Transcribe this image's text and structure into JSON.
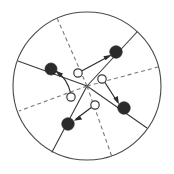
{
  "figure": {
    "title": "",
    "type": "radial-node-diagram",
    "canvas": {
      "width": 174,
      "height": 174,
      "background": "#ffffff"
    },
    "colors": {
      "outline": "#4a4a4a",
      "solid_spoke": "#3a3a3a",
      "dashed_spoke": "#7a7a7a",
      "filled_node": "#2b2b2b",
      "open_node_fill": "#ffffff",
      "open_node_stroke": "#3a3a3a",
      "arrow": "#2b2b2b"
    },
    "boundary": {
      "name": "outer-circle",
      "cx": 87,
      "cy": 86,
      "r": 74,
      "stroke_width": 1.1,
      "style": "solid"
    },
    "hub": {
      "cx": 87,
      "cy": 86
    },
    "spokes": [
      {
        "id": "spoke-1",
        "style": "solid",
        "angle_deg": 200,
        "x1": 87,
        "y1": 86,
        "x2": 18,
        "y2": 61
      },
      {
        "id": "spoke-2",
        "style": "dashed",
        "angle_deg": 246,
        "x1": 87,
        "y1": 86,
        "x2": 57,
        "y2": 18
      },
      {
        "id": "spoke-3",
        "style": "solid",
        "angle_deg": 300,
        "x1": 87,
        "y1": 86,
        "x2": 137,
        "y2": 32
      },
      {
        "id": "spoke-4",
        "style": "dashed",
        "angle_deg": 15,
        "x1": 87,
        "y1": 86,
        "x2": 158,
        "y2": 67
      },
      {
        "id": "spoke-5",
        "style": "solid",
        "angle_deg": 55,
        "x1": 87,
        "y1": 86,
        "x2": 147,
        "y2": 128
      },
      {
        "id": "spoke-6",
        "style": "dashed",
        "angle_deg": 78,
        "x1": 87,
        "y1": 86,
        "x2": 112,
        "y2": 157
      },
      {
        "id": "spoke-7",
        "style": "solid",
        "angle_deg": 118,
        "x1": 87,
        "y1": 86,
        "x2": 52,
        "y2": 152
      },
      {
        "id": "spoke-8",
        "style": "dashed",
        "angle_deg": 160,
        "x1": 87,
        "y1": 86,
        "x2": 19,
        "y2": 111
      }
    ],
    "filled_nodes": [
      {
        "id": "node-f1",
        "label": "",
        "cx": 51,
        "cy": 69,
        "r": 6.0
      },
      {
        "id": "node-f2",
        "label": "",
        "cx": 116,
        "cy": 52,
        "r": 6.2
      },
      {
        "id": "node-f3",
        "label": "",
        "cx": 124,
        "cy": 108,
        "r": 6.2
      },
      {
        "id": "node-f4",
        "label": "",
        "cx": 68,
        "cy": 124,
        "r": 6.2
      }
    ],
    "open_nodes": [
      {
        "id": "node-o1",
        "label": "",
        "cx": 78,
        "cy": 73,
        "r": 4.2
      },
      {
        "id": "node-o2",
        "label": "",
        "cx": 102,
        "cy": 79,
        "r": 4.2
      },
      {
        "id": "node-o3",
        "label": "",
        "cx": 71,
        "cy": 97,
        "r": 4.2
      },
      {
        "id": "node-o4",
        "label": "",
        "cx": 95,
        "cy": 105,
        "r": 4.2
      }
    ],
    "arrows": [
      {
        "id": "arrow-1",
        "from": "node-o1",
        "to": "node-f2",
        "style": "straight",
        "path": "M 82.5 70.5 L 109.5 56.0",
        "head_points": "111.8,54.8 103.4,56.2 105.6,60.3"
      },
      {
        "id": "arrow-2",
        "from": "node-o3",
        "to": "node-f1",
        "style": "curved",
        "path": "M 70.5 92.8 C 68.5 84.0 63.0 76.0 57.0 71.8",
        "head_points": "55.0,70.4 60.0,77.3 63.0,73.6"
      },
      {
        "id": "arrow-3",
        "from": "node-o2",
        "to": "node-f3",
        "style": "straight",
        "path": "M 104.8 82.2 L 117.5 102.0",
        "head_points": "119.0,104.3 117.8,95.9 113.4,98.5"
      },
      {
        "id": "arrow-4",
        "from": "node-o4",
        "to": "node-f4",
        "style": "straight",
        "path": "M 91.6 107.2 L 76.0 119.0",
        "head_points": "73.8,120.7 82.2,119.4 79.5,115.5"
      }
    ]
  }
}
